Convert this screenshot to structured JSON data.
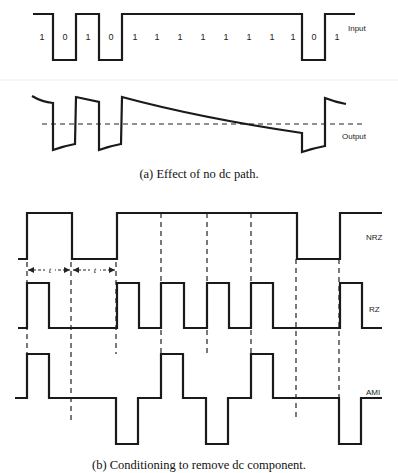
{
  "figure_a": {
    "caption": "(a) Effect of no dc path.",
    "input_label": "Input",
    "output_label": "Output",
    "bits": [
      "1",
      "0",
      "1",
      "0",
      "1",
      "1",
      "1",
      "1",
      "1",
      "1",
      "1",
      "1",
      "0",
      "1"
    ]
  },
  "figure_b": {
    "caption": "(b) Conditioning to remove dc component.",
    "nrz_label": "NRZ",
    "rz_label": "RZ",
    "ami_label": "AMI",
    "period_label_1": "t",
    "period_label_2": "t",
    "bits": [
      "1",
      "0",
      "1",
      "1",
      "1",
      "0",
      "1"
    ]
  }
}
